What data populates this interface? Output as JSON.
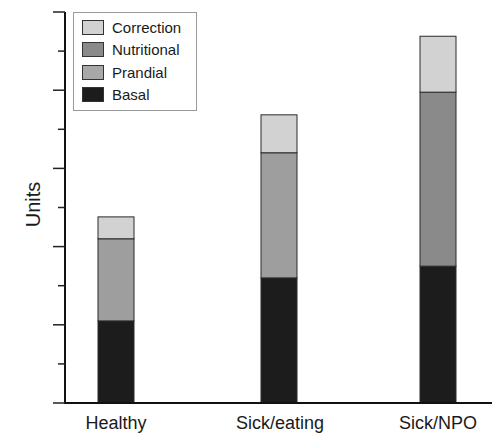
{
  "chart_data": {
    "type": "bar",
    "stacked": true,
    "title": "",
    "xlabel": "",
    "ylabel": "Units",
    "categories": [
      "Healthy",
      "Sick/eating",
      "Sick/NPO"
    ],
    "series": [
      {
        "name": "Basal",
        "color": "#1c1c1c",
        "values": [
          2.1,
          3.2,
          3.5
        ]
      },
      {
        "name": "Prandial",
        "color": "#9e9e9e",
        "values": [
          2.1,
          3.2,
          0
        ]
      },
      {
        "name": "Nutritional",
        "color": "#8a8a8a",
        "values": [
          0,
          0,
          4.45
        ]
      },
      {
        "name": "Correction",
        "color": "#d2d2d2",
        "values": [
          0.56,
          0.97,
          1.43
        ]
      }
    ],
    "totals": [
      4.76,
      7.37,
      9.38
    ],
    "ylim": [
      0,
      10
    ],
    "yticks": {
      "major_count": 6,
      "minor_count": 5,
      "labels_shown": false
    },
    "grid": false,
    "legend": {
      "position": "top-left",
      "order": [
        "Correction",
        "Nutritional",
        "Prandial",
        "Basal"
      ]
    }
  },
  "legend": {
    "items": [
      {
        "label": "Correction",
        "color": "#d2d2d2"
      },
      {
        "label": "Nutritional",
        "color": "#8a8a8a"
      },
      {
        "label": "Prandial",
        "color": "#a8a8a8"
      },
      {
        "label": "Basal",
        "color": "#1c1c1c"
      }
    ]
  },
  "axis": {
    "ylabel": "Units",
    "xticks": [
      "Healthy",
      "Sick/eating",
      "Sick/NPO"
    ]
  }
}
